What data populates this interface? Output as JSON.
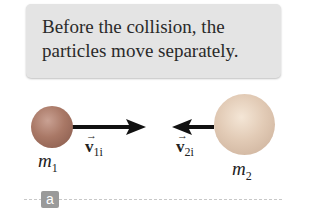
{
  "caption": {
    "line1": "Before the collision, the",
    "line2": "particles move separately."
  },
  "particles": [
    {
      "id": "m1",
      "label": "m",
      "subscript": "1",
      "color": "#a97866"
    },
    {
      "id": "m2",
      "label": "m",
      "subscript": "2",
      "color": "#e2cbb6"
    }
  ],
  "velocities": [
    {
      "id": "v1i",
      "symbol": "v",
      "subscript": "1i",
      "direction": "right"
    },
    {
      "id": "v2i",
      "symbol": "v",
      "subscript": "2i",
      "direction": "left"
    }
  ],
  "panel_tag": "a",
  "colors": {
    "caption_bg": "#e4e4e4",
    "arrow": "#111111",
    "tag_bg": "#9a9a9a"
  }
}
